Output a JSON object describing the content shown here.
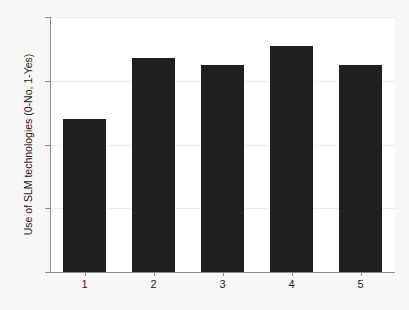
{
  "chart_data": {
    "type": "bar",
    "title": "",
    "xlabel": "",
    "ylabel": "Use of SLM technologies (0-No, 1-Yes)",
    "categories": [
      "1",
      "2",
      "3",
      "4",
      "5"
    ],
    "values": [
      0.48,
      0.67,
      0.65,
      0.71,
      0.65
    ],
    "ylim": [
      0,
      0.8
    ],
    "yticks": [
      "0",
      ".2",
      ".4",
      ".6",
      ".8"
    ],
    "ytick_values": [
      0,
      0.2,
      0.4,
      0.6,
      0.8
    ],
    "grid": true,
    "legend": null,
    "bar_color": "#1f1f1f",
    "plot_background": "#ffffff",
    "figure_background": "#f7f7f7",
    "axis_color": "#8d8d8d",
    "grid_color": "#ececec"
  }
}
